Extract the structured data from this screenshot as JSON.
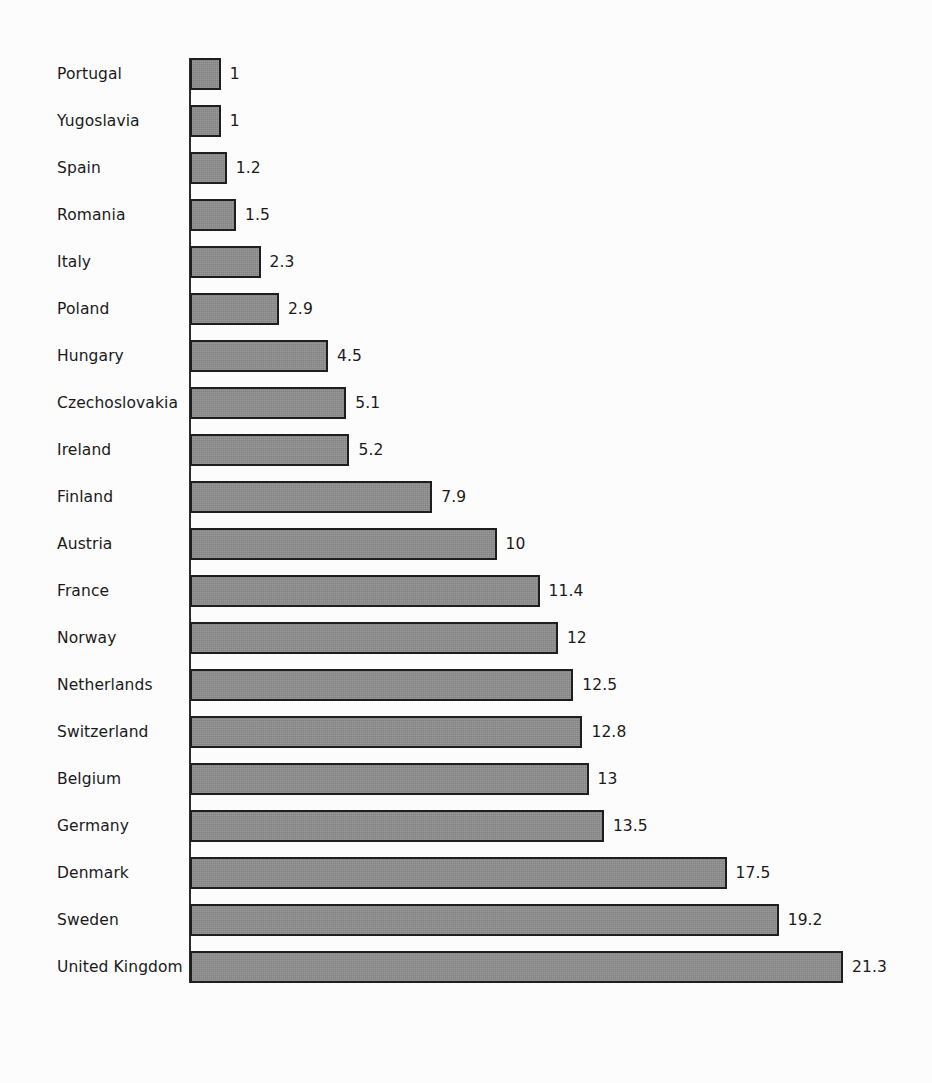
{
  "chart_data": {
    "type": "bar",
    "orientation": "horizontal",
    "title": "",
    "subtitle": "",
    "xlabel": "",
    "ylabel": "",
    "grid": false,
    "legend": null,
    "axis_ticks": [],
    "xlim": [
      0,
      21.3
    ],
    "categories": [
      "Portugal",
      "Yugoslavia",
      "Spain",
      "Romania",
      "Italy",
      "Poland",
      "Hungary",
      "Czechoslovakia",
      "Ireland",
      "Finland",
      "Austria",
      "France",
      "Norway",
      "Netherlands",
      "Switzerland",
      "Belgium",
      "Germany",
      "Denmark",
      "Sweden",
      "United Kingdom"
    ],
    "values": [
      1,
      1,
      1.2,
      1.5,
      2.3,
      2.9,
      4.5,
      5.1,
      5.2,
      7.9,
      10,
      11.4,
      12,
      12.5,
      12.8,
      13,
      13.5,
      17.5,
      19.2,
      21.3
    ],
    "value_labels": [
      "1",
      "1",
      "1.2",
      "1.5",
      "2.3",
      "2.9",
      "4.5",
      "5.1",
      "5.2",
      "7.9",
      "10",
      "11.4",
      "12",
      "12.5",
      "12.8",
      "13",
      "13.5",
      "17.5",
      "19.2",
      "21.3"
    ]
  },
  "style": {
    "background_color": "#fcfcfc",
    "bar_fill_color": "#8d8d8d",
    "bar_border_color": "#1e1e1e",
    "axis_color": "#2b2b2b",
    "text_color": "#1a1a1a"
  },
  "layout": {
    "axis_x": 190,
    "first_bar_top": 58,
    "row_pitch": 47,
    "bar_height": 32,
    "px_per_unit": 30.66,
    "label_x": 57,
    "value_gap": 9
  }
}
